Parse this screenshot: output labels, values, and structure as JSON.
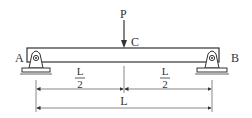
{
  "diagram": {
    "type": "simply-supported-beam",
    "load": {
      "label": "P",
      "position_label": "C"
    },
    "supports": [
      {
        "label": "A",
        "side": "left"
      },
      {
        "label": "B",
        "side": "right"
      }
    ],
    "dimensions": {
      "half_left": {
        "numerator": "L",
        "denominator": "2"
      },
      "half_right": {
        "numerator": "L",
        "denominator": "2"
      },
      "total": "L"
    },
    "colors": {
      "line": "#333333",
      "background": "#ffffff"
    }
  }
}
